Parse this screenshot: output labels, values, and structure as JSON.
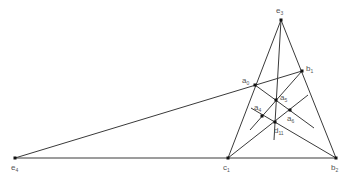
{
  "diagram": {
    "type": "geometric-configuration",
    "points": [
      {
        "id": "e3",
        "name": "e",
        "sub": "3",
        "x": 281,
        "y": 20,
        "lx": 276,
        "ly": 7
      },
      {
        "id": "b1",
        "name": "b",
        "sub": "1",
        "x": 302,
        "y": 71,
        "lx": 306,
        "ly": 65
      },
      {
        "id": "a0",
        "name": "a",
        "sub": "0",
        "x": 255,
        "y": 85,
        "lx": 242,
        "ly": 77
      },
      {
        "id": "a5",
        "name": "a",
        "sub": "5",
        "x": 276,
        "y": 100,
        "lx": 280,
        "ly": 94
      },
      {
        "id": "a4",
        "name": "a",
        "sub": "4",
        "x": 262,
        "y": 116,
        "lx": 254,
        "ly": 104
      },
      {
        "id": "a6",
        "name": "a",
        "sub": "6",
        "x": 290,
        "y": 110,
        "lx": 287,
        "ly": 115
      },
      {
        "id": "d11",
        "name": "d",
        "sub": "11",
        "x": 275,
        "y": 122,
        "lx": 274,
        "ly": 127
      },
      {
        "id": "e4",
        "name": "e",
        "sub": "4",
        "x": 15,
        "y": 158,
        "lx": 11,
        "ly": 164
      },
      {
        "id": "c1",
        "name": "c",
        "sub": "1",
        "x": 228,
        "y": 158,
        "lx": 223,
        "ly": 164
      },
      {
        "id": "b2",
        "name": "b",
        "sub": "2",
        "x": 336,
        "y": 158,
        "lx": 331,
        "ly": 164
      }
    ],
    "lines": [
      {
        "from": [
          281,
          20
        ],
        "to": [
          228,
          158
        ]
      },
      {
        "from": [
          281,
          20
        ],
        "to": [
          336,
          158
        ]
      },
      {
        "from": [
          15,
          158
        ],
        "to": [
          336,
          158
        ]
      },
      {
        "from": [
          15,
          158
        ],
        "to": [
          302,
          71
        ]
      },
      {
        "from": [
          281,
          20
        ],
        "to": [
          274,
          140
        ]
      },
      {
        "from": [
          302,
          71
        ],
        "to": [
          250,
          130
        ]
      },
      {
        "from": [
          255,
          85
        ],
        "to": [
          314,
          128
        ]
      },
      {
        "from": [
          228,
          158
        ],
        "to": [
          308,
          95
        ]
      },
      {
        "from": [
          251,
          108
        ],
        "to": [
          336,
          158
        ]
      }
    ]
  }
}
